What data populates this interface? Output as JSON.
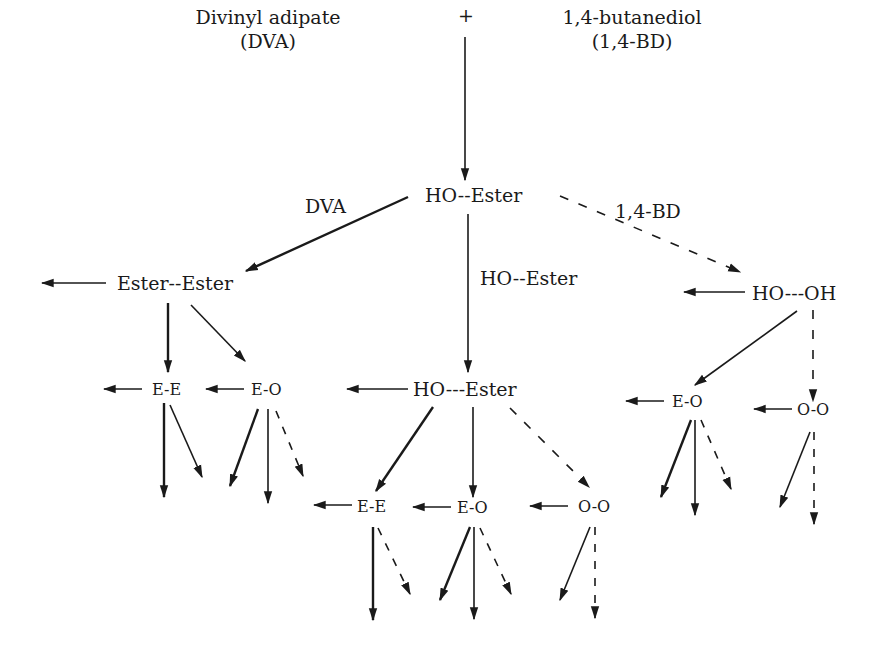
{
  "reactants": {
    "left_name": "Divinyl adipate",
    "left_abbr": "(DVA)",
    "plus": "+",
    "right_name": "1,4-butanediol",
    "right_abbr": "(1,4-BD)"
  },
  "nodes": {
    "ho_ester": "HO--Ester",
    "ester_ester": "Ester--Ester",
    "ho_oh": "HO---OH",
    "ho_ester_2": "HO---Ester",
    "ee_left": "E-E",
    "eo_left": "E-O",
    "ee_mid": "E-E",
    "eo_mid": "E-O",
    "oo_mid": "O-O",
    "eo_right": "E-O",
    "oo_right": "O-O"
  },
  "edge_labels": {
    "dva": "DVA",
    "bd": "1,4-BD",
    "ho_ester": "HO--Ester"
  },
  "colors": {
    "ink": "#1a1a1a",
    "background": "#ffffff"
  },
  "legend_semantics": {
    "solid_thick": "reaction with DVA (ester end)",
    "solid_thin": "reaction with HO--Ester",
    "dashed": "reaction with 1,4-BD"
  }
}
